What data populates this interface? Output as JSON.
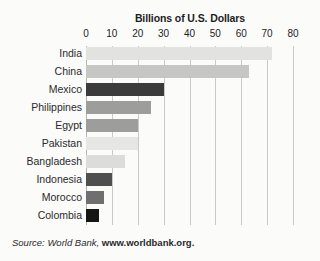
{
  "chart_data": {
    "type": "bar",
    "orientation": "horizontal",
    "title": "Billions of U.S. Dollars",
    "xlabel": "",
    "ylabel": "",
    "xlim": [
      0,
      80
    ],
    "xticks": [
      0,
      10,
      20,
      30,
      40,
      50,
      60,
      70,
      80
    ],
    "xtick_labels": [
      "0",
      "10",
      "20",
      "30",
      "40",
      "50",
      "60",
      "70",
      "80"
    ],
    "grid": true,
    "legend": "none",
    "categories": [
      "India",
      "China",
      "Mexico",
      "Philippines",
      "Egypt",
      "Pakistan",
      "Bangladesh",
      "Indonesia",
      "Morocco",
      "Colombia"
    ],
    "values": [
      72,
      63,
      30,
      25,
      20,
      20,
      15,
      10,
      7,
      5
    ],
    "bars": [
      {
        "label": "India",
        "value": 72,
        "color": "#e2e2e0"
      },
      {
        "label": "China",
        "value": 63,
        "color": "#c6c6c4"
      },
      {
        "label": "Mexico",
        "value": 30,
        "color": "#3b3b3b"
      },
      {
        "label": "Philippines",
        "value": 25,
        "color": "#9d9d9b"
      },
      {
        "label": "Egypt",
        "value": 20,
        "color": "#9d9d9b"
      },
      {
        "label": "Pakistan",
        "value": 20,
        "color": "#e6e6e4"
      },
      {
        "label": "Bangladesh",
        "value": 15,
        "color": "#dcdcda"
      },
      {
        "label": "Indonesia",
        "value": 10,
        "color": "#4f4f4f"
      },
      {
        "label": "Morocco",
        "value": 7,
        "color": "#6f6f6f"
      },
      {
        "label": "Colombia",
        "value": 5,
        "color": "#151515"
      }
    ]
  },
  "source": {
    "prefix": "Source: World Bank, ",
    "url": "www.worldbank.org."
  }
}
